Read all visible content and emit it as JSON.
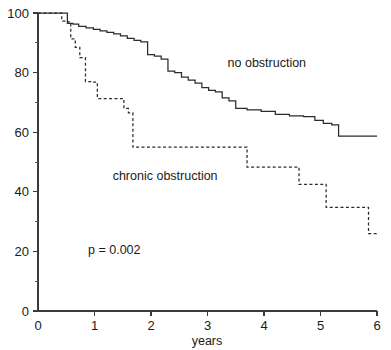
{
  "chart_data": {
    "type": "line",
    "title": "",
    "subtitle": "",
    "xlabel": "years",
    "ylabel": "",
    "xlim": [
      0,
      6
    ],
    "ylim": [
      0,
      100
    ],
    "grid": false,
    "legend_position": "inline-annotations",
    "x_ticks": [
      "0",
      "1",
      "2",
      "3",
      "4",
      "5",
      "6"
    ],
    "x_tick_values": [
      0,
      1,
      2,
      3,
      4,
      5,
      6
    ],
    "x_minor_ticks": [],
    "y_ticks": [
      "0",
      "20",
      "40",
      "60",
      "80",
      "100"
    ],
    "y_tick_values": [
      0,
      20,
      40,
      60,
      80,
      100
    ],
    "y_minor_ticks": [
      10,
      30,
      50,
      70,
      90
    ],
    "step_style": "post",
    "annotations": [
      {
        "text": "no obstruction",
        "x": 4.05,
        "y": 82
      },
      {
        "text": "chronic obstruction",
        "x": 2.25,
        "y": 44
      },
      {
        "text": "p = 0.002",
        "x": 1.35,
        "y": 19
      }
    ],
    "series": [
      {
        "name": "no obstruction",
        "style": "solid",
        "color": "#2b2b2b",
        "x": [
          0.0,
          0.42,
          0.52,
          0.62,
          0.72,
          0.85,
          0.98,
          1.1,
          1.22,
          1.34,
          1.46,
          1.58,
          1.7,
          1.82,
          1.94,
          2.06,
          2.18,
          2.3,
          2.42,
          2.54,
          2.66,
          2.78,
          2.9,
          3.02,
          3.14,
          3.26,
          3.38,
          3.5,
          3.7,
          3.95,
          4.2,
          4.45,
          4.7,
          4.9,
          5.05,
          5.2,
          5.32,
          6.0
        ],
        "y": [
          100.0,
          100.0,
          96.5,
          96.3,
          95.5,
          95.0,
          94.5,
          94.0,
          93.5,
          93.0,
          92.3,
          91.5,
          90.8,
          90.3,
          86.0,
          85.5,
          84.5,
          80.5,
          80.0,
          78.5,
          77.5,
          76.5,
          75.0,
          74.0,
          73.5,
          71.5,
          70.5,
          68.0,
          67.5,
          67.0,
          66.0,
          65.5,
          65.2,
          64.0,
          63.0,
          62.5,
          58.7,
          58.7
        ]
      },
      {
        "name": "chronic obstruction",
        "style": "dashed",
        "color": "#2b2b2b",
        "x": [
          0.0,
          0.33,
          0.42,
          0.5,
          0.58,
          0.66,
          0.74,
          0.84,
          0.95,
          1.05,
          1.45,
          1.52,
          1.6,
          1.68,
          3.62,
          3.7,
          4.55,
          4.62,
          5.02,
          5.1,
          5.78,
          5.85,
          6.0
        ],
        "y": [
          100.0,
          100.0,
          97.3,
          97.0,
          91.3,
          88.5,
          85.0,
          77.0,
          76.8,
          71.3,
          71.3,
          68.0,
          66.5,
          55.0,
          55.0,
          48.3,
          48.3,
          42.5,
          42.5,
          34.8,
          34.8,
          26.0,
          26.0
        ]
      }
    ]
  },
  "axes": {
    "x_axis_title": "years",
    "x_tick_labels": [
      "0",
      "1",
      "2",
      "3",
      "4",
      "5",
      "6"
    ],
    "y_tick_labels": [
      "0",
      "20",
      "40",
      "60",
      "80",
      "100"
    ]
  },
  "labels": {
    "no_obstruction": "no obstruction",
    "chronic_obstruction": "chronic obstruction",
    "p_value": "p = 0.002"
  },
  "colors": {
    "axis": "#3b3b3b",
    "curve": "#2b2b2b",
    "text": "#1a1a1a",
    "background": "#ffffff"
  }
}
